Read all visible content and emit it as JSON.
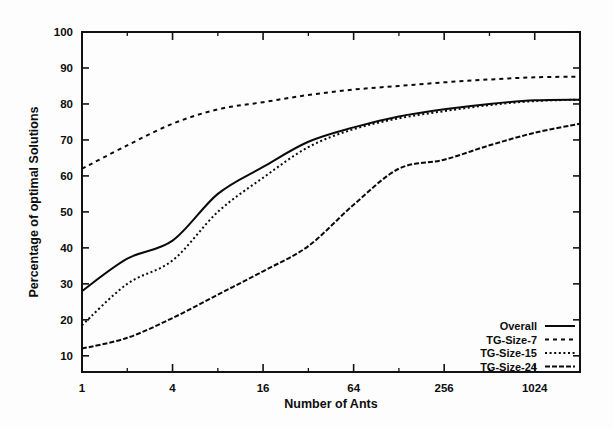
{
  "figure": {
    "background_color": "#fdfdfd",
    "ink_color": "#0a0a0a"
  },
  "chart_data": {
    "type": "line",
    "title": "",
    "xlabel": "Number of Ants",
    "ylabel": "Percentage of optimal Solutions",
    "xscale": "log",
    "xbase": 4,
    "xlim": [
      1,
      2048
    ],
    "ylim": [
      5.5,
      100
    ],
    "grid": false,
    "legend_position": "bottom-right",
    "xticks": [
      1,
      4,
      16,
      64,
      256,
      1024
    ],
    "xtick_labels": [
      "1",
      "4",
      "16",
      "64",
      "256",
      "1024"
    ],
    "yticks": [
      10,
      20,
      30,
      40,
      50,
      60,
      70,
      80,
      90,
      100
    ],
    "ytick_labels": [
      "10",
      "20",
      "30",
      "40",
      "50",
      "60",
      "70",
      "80",
      "90",
      "100"
    ],
    "x": [
      1,
      2,
      4,
      8,
      16,
      32,
      64,
      128,
      256,
      512,
      1024,
      2048
    ],
    "series": [
      {
        "name": "Overall",
        "style": "solid",
        "values": [
          28.0,
          37.0,
          42.0,
          55.0,
          62.5,
          69.5,
          73.5,
          76.5,
          78.5,
          80.0,
          81.0,
          81.2
        ]
      },
      {
        "name": "TG-Size-7",
        "style": "dashed",
        "values": [
          62.0,
          68.5,
          74.5,
          78.5,
          80.5,
          82.5,
          84.0,
          85.0,
          86.0,
          86.8,
          87.4,
          87.6
        ]
      },
      {
        "name": "TG-Size-15",
        "style": "dotted",
        "values": [
          18.5,
          30.0,
          36.5,
          50.0,
          59.5,
          68.0,
          73.0,
          76.0,
          78.0,
          79.7,
          80.8,
          81.2
        ]
      },
      {
        "name": "TG-Size-24",
        "style": "dashed-dense",
        "values": [
          12.0,
          15.0,
          20.5,
          27.0,
          33.5,
          40.5,
          52.0,
          62.0,
          64.5,
          68.5,
          72.0,
          74.5
        ]
      }
    ]
  },
  "legend": {
    "entries": [
      {
        "label": "Overall",
        "style": "solid"
      },
      {
        "label": "TG-Size-7",
        "style": "dashed"
      },
      {
        "label": "TG-Size-15",
        "style": "dotted"
      },
      {
        "label": "TG-Size-24",
        "style": "dashed-dense"
      }
    ]
  }
}
